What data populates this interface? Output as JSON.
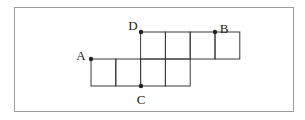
{
  "diagram": {
    "frame": {
      "x": 14,
      "y": 7,
      "w": 279,
      "h": 104,
      "stroke": "#9a9a9a"
    },
    "line_color": "#3a3a3a",
    "dot_color": "#222222",
    "cell_w": 24.8,
    "cell_h": 27,
    "cells": [
      {
        "col": 0,
        "row": 1
      },
      {
        "col": 1,
        "row": 1
      },
      {
        "col": 2,
        "row": 1
      },
      {
        "col": 3,
        "row": 1
      },
      {
        "col": 2,
        "row": 0
      },
      {
        "col": 3,
        "row": 0
      },
      {
        "col": 4,
        "row": 0
      },
      {
        "col": 5,
        "row": 0
      }
    ],
    "origin": {
      "x": 91,
      "y": 32
    },
    "points": [
      {
        "id": "A",
        "label": "A",
        "x": 91,
        "y": 59,
        "lx": 81,
        "ly": 57
      },
      {
        "id": "B",
        "label": "B",
        "x": 215,
        "y": 32,
        "lx": 224,
        "ly": 30
      },
      {
        "id": "C",
        "label": "C",
        "x": 141,
        "y": 86,
        "lx": 141,
        "ly": 101
      },
      {
        "id": "D",
        "label": "D",
        "x": 141,
        "y": 32,
        "lx": 133,
        "ly": 27
      }
    ]
  }
}
